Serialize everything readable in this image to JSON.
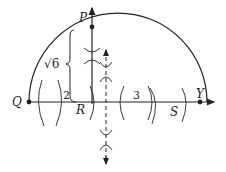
{
  "diagram": {
    "type": "geometric-construction",
    "points": {
      "P": {
        "label": "P"
      },
      "Q": {
        "label": "Q"
      },
      "R": {
        "label": "R"
      },
      "S": {
        "label": "S"
      },
      "Y": {
        "label": "Y"
      }
    },
    "segments": {
      "QR": {
        "label": "2"
      },
      "RS": {
        "label": "3"
      },
      "PR": {
        "label": "√6"
      }
    },
    "colors": {
      "stroke": "#222222",
      "background": "#ffffff"
    }
  }
}
